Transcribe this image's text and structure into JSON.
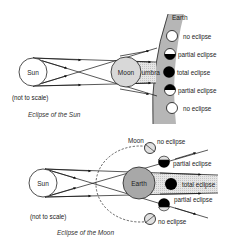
{
  "colors": {
    "line": "#111111",
    "earth_band": "#b4b4b4",
    "moon_fill": "#d8d8d8",
    "earth_fill": "#a8a8a8",
    "umbra_fill": "#dcdcdc",
    "eclipse_dark": "#000000"
  },
  "solar": {
    "sun_label": "Sun",
    "moon_label": "Moon",
    "umbra_label": "umbra",
    "earth_label": "Earth",
    "note": "(not to scale)",
    "caption": "Eclipse of the Sun",
    "states": [
      {
        "label": "no eclipse",
        "type": "none"
      },
      {
        "label": "partial eclipse",
        "type": "partial-bottom"
      },
      {
        "label": "total eclipse",
        "type": "total"
      },
      {
        "label": "partial eclipse",
        "type": "partial-top"
      },
      {
        "label": "no eclipse",
        "type": "none"
      }
    ]
  },
  "lunar": {
    "sun_label": "Sun",
    "earth_label": "Earth",
    "moon_label": "Moon",
    "note": "(not to scale)",
    "caption": "Eclipse of the Moon",
    "states": [
      {
        "label": "no eclipse",
        "type": "none"
      },
      {
        "label": "partial eclipse",
        "type": "partial"
      },
      {
        "label": "total eclipse",
        "type": "total"
      },
      {
        "label": "partial eclipse",
        "type": "partial"
      },
      {
        "label": "no eclipse",
        "type": "none"
      }
    ]
  }
}
